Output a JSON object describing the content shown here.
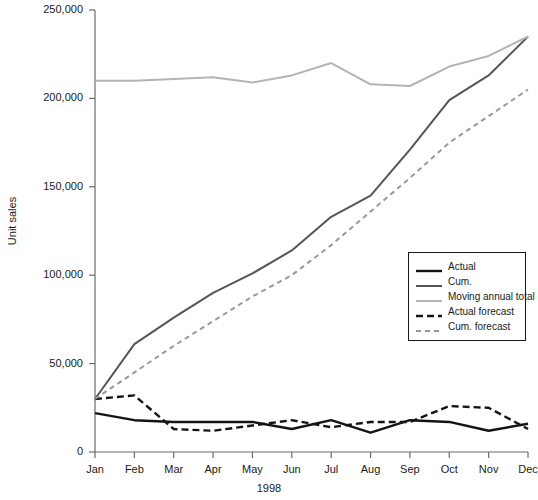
{
  "chart_data": {
    "type": "line",
    "title": "",
    "xlabel": "1998",
    "ylabel": "Unit sales",
    "categories": [
      "Jan",
      "Feb",
      "Mar",
      "Apr",
      "May",
      "Jun",
      "Jul",
      "Aug",
      "Sep",
      "Oct",
      "Nov",
      "Dec"
    ],
    "ylim": [
      0,
      250000
    ],
    "yticks": [
      0,
      50000,
      100000,
      150000,
      200000,
      250000
    ],
    "ytick_labels": [
      "0",
      "50,000",
      "100,000",
      "150,000",
      "200,000",
      "250,000"
    ],
    "grid": false,
    "legend_position": "inside-right",
    "series": [
      {
        "name": "Actual",
        "style": "solid",
        "color": "#141414",
        "width": 2.4,
        "values": [
          22000,
          18000,
          17000,
          17000,
          17000,
          13000,
          18000,
          11000,
          18000,
          17000,
          12000,
          16000
        ]
      },
      {
        "name": "Cum.",
        "style": "solid",
        "color": "#555555",
        "width": 2.0,
        "values": [
          30000,
          61000,
          76000,
          90000,
          101000,
          114000,
          133000,
          145000,
          171000,
          199000,
          213000,
          235000
        ]
      },
      {
        "name": "Moving annual total",
        "style": "solid",
        "color": "#b4b4b4",
        "width": 2.0,
        "values": [
          210000,
          210000,
          211000,
          212000,
          209000,
          213000,
          220000,
          208000,
          207000,
          218000,
          224000,
          235000
        ]
      },
      {
        "name": "Actual forecast",
        "style": "dashed",
        "color": "#141414",
        "width": 2.4,
        "values": [
          30000,
          32000,
          13000,
          12000,
          15000,
          18000,
          14000,
          17000,
          17000,
          26000,
          25000,
          13000
        ]
      },
      {
        "name": "Cum. forecast",
        "style": "dashed",
        "color": "#999999",
        "width": 2.0,
        "values": [
          30000,
          45000,
          60000,
          74000,
          88000,
          100000,
          117000,
          136000,
          155000,
          175000,
          190000,
          205000
        ]
      }
    ]
  },
  "legend": {
    "items": [
      {
        "label": "Actual"
      },
      {
        "label": "Cum."
      },
      {
        "label": "Moving annual total"
      },
      {
        "label": "Actual forecast"
      },
      {
        "label": "Cum. forecast"
      }
    ]
  }
}
